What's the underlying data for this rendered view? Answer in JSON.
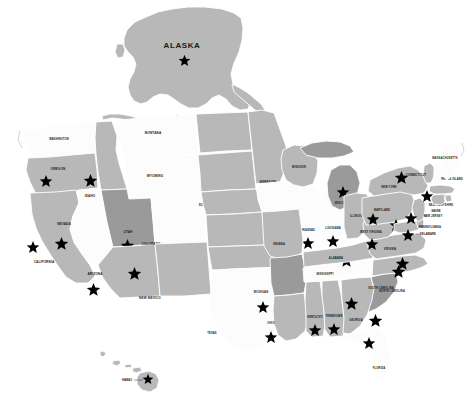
{
  "map": {
    "title": "United States star-marked states map",
    "background_color": "#ffffff",
    "fill_colors": {
      "white": "#fcfcfc",
      "light_gray": "#e3e3e3",
      "gray": "#b8b8b8",
      "dark_gray": "#9a9a9a",
      "border": "#ffffff",
      "star": "#000000",
      "label": "#1a1a1a"
    },
    "inset_labels": {
      "alaska": "ALASKA",
      "hawaii": "HAWAII"
    },
    "states": [
      {
        "id": "AK",
        "label": "ALASKA",
        "shade": "gray",
        "star": true
      },
      {
        "id": "HI",
        "label": "HAWAII",
        "shade": "gray",
        "star": true
      },
      {
        "id": "WA",
        "label": "WASHINGTON",
        "shade": "white",
        "star": false
      },
      {
        "id": "OR",
        "label": "OREGON",
        "shade": "gray",
        "star": true
      },
      {
        "id": "CA",
        "label": "CALIFORNIA",
        "shade": "gray",
        "star": true
      },
      {
        "id": "NV",
        "label": "NEVADA",
        "shade": "white",
        "star": true
      },
      {
        "id": "ID",
        "label": "IDAHO",
        "shade": "gray",
        "star": true
      },
      {
        "id": "MT",
        "label": "MONTANA",
        "shade": "white",
        "star": false
      },
      {
        "id": "WY",
        "label": "WYOMING",
        "shade": "white",
        "star": false
      },
      {
        "id": "UT",
        "label": "UTAH",
        "shade": "dark_gray",
        "star": true
      },
      {
        "id": "AZ",
        "label": "ARIZONA",
        "shade": "gray",
        "star": true
      },
      {
        "id": "CO",
        "label": "COLORADO",
        "shade": "white",
        "star": false
      },
      {
        "id": "NM",
        "label": "NEW MEXICO",
        "shade": "gray",
        "star": true
      },
      {
        "id": "ND",
        "label": "NORTH DAKOTA",
        "shade": "gray",
        "star": true
      },
      {
        "id": "SD",
        "label": "SOUTH DAKOTA",
        "shade": "gray",
        "star": false
      },
      {
        "id": "NE",
        "label": "NEBRASKA",
        "shade": "gray",
        "star": false
      },
      {
        "id": "KS",
        "label": "KANSAS",
        "shade": "gray",
        "star": false
      },
      {
        "id": "OK",
        "label": "OKLAHOMA",
        "shade": "gray",
        "star": false
      },
      {
        "id": "TX",
        "label": "TEXAS",
        "shade": "white",
        "star": false
      },
      {
        "id": "MN",
        "label": "MINNESOTA",
        "shade": "gray",
        "star": false
      },
      {
        "id": "IA",
        "label": "IOWA",
        "shade": "white",
        "star": false
      },
      {
        "id": "MO",
        "label": "MISSOURI",
        "shade": "gray",
        "star": false
      },
      {
        "id": "AR",
        "label": "ARKANSAS",
        "shade": "dark_gray",
        "star": true
      },
      {
        "id": "LA",
        "label": "LOUISIANA",
        "shade": "gray",
        "star": true
      },
      {
        "id": "WI",
        "label": "WISCONSIN",
        "shade": "gray",
        "star": false
      },
      {
        "id": "IL",
        "label": "ILLINOIS",
        "shade": "white",
        "star": true
      },
      {
        "id": "IN",
        "label": "INDIANA",
        "shade": "white",
        "star": true
      },
      {
        "id": "MI",
        "label": "MICHIGAN",
        "shade": "dark_gray",
        "star": true
      },
      {
        "id": "OH",
        "label": "OHIO",
        "shade": "gray",
        "star": false
      },
      {
        "id": "KY",
        "label": "KENTUCKY",
        "shade": "gray",
        "star": false
      },
      {
        "id": "TN",
        "label": "TENNESSEE",
        "shade": "white",
        "star": true
      },
      {
        "id": "MS",
        "label": "MISSISSIPPI",
        "shade": "gray",
        "star": true
      },
      {
        "id": "AL",
        "label": "ALABAMA",
        "shade": "gray",
        "star": true
      },
      {
        "id": "GA",
        "label": "GEORGIA",
        "shade": "gray",
        "star": true
      },
      {
        "id": "FL",
        "label": "FLORIDA",
        "shade": "white",
        "star": true
      },
      {
        "id": "SC",
        "label": "SOUTH CAROLINA",
        "shade": "dark_gray",
        "star": true
      },
      {
        "id": "NC",
        "label": "NORTH CAROLINA",
        "shade": "gray",
        "star": true
      },
      {
        "id": "VA",
        "label": "VIRGINIA",
        "shade": "gray",
        "star": true
      },
      {
        "id": "WV",
        "label": "WEST VIRGINIA",
        "shade": "gray",
        "star": true
      },
      {
        "id": "MD",
        "label": "MARYLAND",
        "shade": "gray",
        "star": true
      },
      {
        "id": "DE",
        "label": "DELAWARE",
        "shade": "gray",
        "star": true
      },
      {
        "id": "PA",
        "label": "PENNSYLVANIA",
        "shade": "gray",
        "star": true
      },
      {
        "id": "NJ",
        "label": "NEW JERSEY",
        "shade": "gray",
        "star": true
      },
      {
        "id": "NY",
        "label": "NEW YORK",
        "shade": "gray",
        "star": true
      },
      {
        "id": "CT",
        "label": "CONNECTICUT",
        "shade": "gray",
        "star": true
      },
      {
        "id": "RI",
        "label": "RHODE ISLAND",
        "shade": "gray",
        "star": true
      },
      {
        "id": "MA",
        "label": "MASSACHUSETTS",
        "shade": "gray",
        "star": true
      },
      {
        "id": "VT",
        "label": "VERMONT",
        "shade": "gray",
        "star": false
      },
      {
        "id": "NH",
        "label": "NEW HAMPSHIRE",
        "shade": "white",
        "star": false
      },
      {
        "id": "ME",
        "label": "MAINE",
        "shade": "white",
        "star": false
      }
    ]
  }
}
